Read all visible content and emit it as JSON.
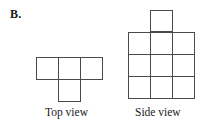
{
  "problem": {
    "label": "B."
  },
  "figures": [
    {
      "id": "top-view",
      "caption": "Top view",
      "shape_name": "T-tetromino-rotated",
      "cell_size": 22,
      "cells": [
        {
          "col": 0,
          "row": 0
        },
        {
          "col": 1,
          "row": 0
        },
        {
          "col": 2,
          "row": 0
        },
        {
          "col": 1,
          "row": 1
        }
      ],
      "cols": 3,
      "rows": 2
    },
    {
      "id": "side-view",
      "caption": "Side view",
      "shape_name": "three-by-three-grid-with-top-middle-square",
      "cell_size": 22,
      "cells": [
        {
          "col": 1,
          "row": 0
        },
        {
          "col": 0,
          "row": 1
        },
        {
          "col": 1,
          "row": 1
        },
        {
          "col": 2,
          "row": 1
        },
        {
          "col": 0,
          "row": 2
        },
        {
          "col": 1,
          "row": 2
        },
        {
          "col": 2,
          "row": 2
        },
        {
          "col": 0,
          "row": 3
        },
        {
          "col": 1,
          "row": 3
        },
        {
          "col": 2,
          "row": 3
        }
      ],
      "cols": 3,
      "rows": 4
    }
  ],
  "style": {
    "line_color": "#4a4a4a",
    "fill_color": "#ffffff",
    "background": "#ffffff",
    "stroke_width": 1.6
  }
}
